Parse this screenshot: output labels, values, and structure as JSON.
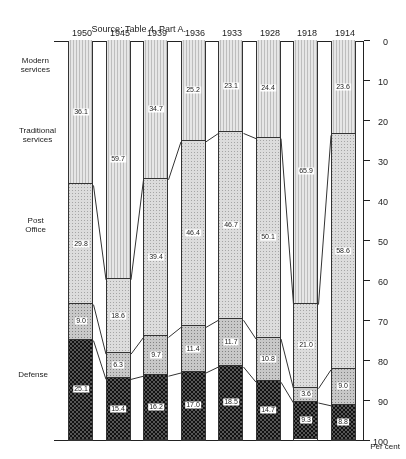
{
  "chart_data": {
    "type": "bar",
    "stacked": true,
    "orientation": "vertical",
    "rotation_deg": 180,
    "title": "",
    "source_note": "Source: Table 4, Part A.",
    "ylabel": "Per cent",
    "ylim": [
      0,
      100
    ],
    "yticks": [
      0,
      10,
      20,
      30,
      40,
      50,
      60,
      70,
      80,
      90,
      100
    ],
    "categories": [
      "1914",
      "1918",
      "1928",
      "1933",
      "1936",
      "1939",
      "1945",
      "1950"
    ],
    "series": [
      {
        "name": "Defense",
        "values": [
          23.6,
          65.9,
          24.4,
          23.1,
          25.2,
          34.7,
          59.7,
          36.1
        ]
      },
      {
        "name": "Post Office",
        "values": [
          58.6,
          21.0,
          50.1,
          46.7,
          46.4,
          39.4,
          18.6,
          29.8
        ]
      },
      {
        "name": "Traditional services",
        "values": [
          9.0,
          3.6,
          10.8,
          11.7,
          11.4,
          9.7,
          6.3,
          9.0
        ]
      },
      {
        "name": "Modern services",
        "values": [
          8.8,
          9.3,
          14.7,
          18.5,
          17.0,
          16.2,
          15.4,
          25.1
        ]
      }
    ],
    "grid": false,
    "legend_position": "side-labels"
  },
  "labels": {
    "source": "Source: Table 4, Part A.",
    "axis_title": "Per cent",
    "categories": {
      "defense": "Defense",
      "post_office_1": "Post",
      "post_office_2": "Office",
      "traditional_1": "Traditional",
      "traditional_2": "services",
      "modern_1": "Modern",
      "modern_2": "services"
    },
    "ticks": [
      "0",
      "10",
      "20",
      "30",
      "40",
      "50",
      "60",
      "70",
      "80",
      "90",
      "100"
    ],
    "years": [
      "1914",
      "1918",
      "1928",
      "1933",
      "1936",
      "1939",
      "1945",
      "1950"
    ]
  }
}
